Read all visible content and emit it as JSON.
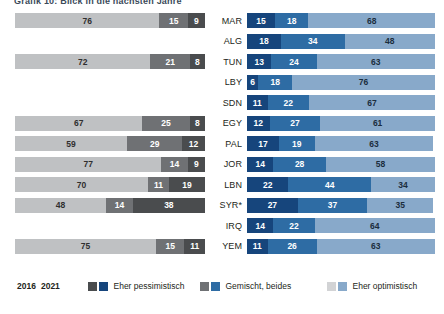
{
  "title": "Grafik 10: Blick in die nächsten Jahre",
  "legend": {
    "year_2016": "2016",
    "year_2021": "2021",
    "items": [
      {
        "label": "Eher pessimistisch",
        "color_2016": "#4a4c4e",
        "color_2021": "#16457c"
      },
      {
        "label": "Gemischt, beides",
        "color_2016": "#6f7174",
        "color_2021": "#2e6ca4"
      },
      {
        "label": "Eher optimistisch",
        "color_2016": "#bfc1c3",
        "color_2021": "#88a9ca"
      }
    ]
  },
  "chart_data": {
    "type": "bar",
    "title": "Grafik 10: Blick in die nächsten Jahre",
    "xlabel": "",
    "ylabel": "",
    "xlim": [
      0,
      100
    ],
    "grid": false,
    "legend_position": "bottom",
    "orientation": "horizontal",
    "stacked": true,
    "categories": [
      "MAR",
      "ALG",
      "TUN",
      "LBY",
      "SDN",
      "EGY",
      "PAL",
      "JOR",
      "LBN",
      "SYR*",
      "IRQ",
      "YEM"
    ],
    "panels": [
      {
        "name": "2016",
        "series": [
          {
            "name": "Eher optimistisch",
            "color": "#bfc1c3",
            "values": [
              76,
              null,
              72,
              null,
              null,
              67,
              59,
              77,
              70,
              48,
              null,
              75
            ]
          },
          {
            "name": "Gemischt, beides",
            "color": "#6f7174",
            "values": [
              15,
              null,
              21,
              null,
              null,
              25,
              29,
              14,
              11,
              14,
              null,
              15
            ]
          },
          {
            "name": "Eher pessimistisch",
            "color": "#4a4c4e",
            "values": [
              9,
              null,
              8,
              null,
              null,
              8,
              12,
              9,
              19,
              38,
              null,
              11
            ]
          }
        ]
      },
      {
        "name": "2021",
        "series": [
          {
            "name": "Eher pessimistisch",
            "color": "#16457c",
            "values": [
              15,
              18,
              13,
              6,
              11,
              12,
              17,
              14,
              22,
              27,
              14,
              11
            ]
          },
          {
            "name": "Gemischt, beides",
            "color": "#2e6ca4",
            "values": [
              18,
              34,
              24,
              18,
              22,
              27,
              19,
              28,
              44,
              37,
              22,
              26
            ]
          },
          {
            "name": "Eher optimistisch",
            "color": "#88a9ca",
            "values": [
              68,
              48,
              63,
              76,
              67,
              61,
              63,
              58,
              34,
              35,
              64,
              63
            ]
          }
        ]
      }
    ]
  },
  "rows": [
    {
      "country": "MAR",
      "left": {
        "present": true,
        "opt": "76",
        "mix": "15",
        "pes": "9"
      },
      "right": {
        "pes": "15",
        "mix": "18",
        "opt": "68"
      }
    },
    {
      "country": "ALG",
      "left": {
        "present": false,
        "opt": "",
        "mix": "",
        "pes": ""
      },
      "right": {
        "pes": "18",
        "mix": "34",
        "opt": "48"
      }
    },
    {
      "country": "TUN",
      "left": {
        "present": true,
        "opt": "72",
        "mix": "21",
        "pes": "8"
      },
      "right": {
        "pes": "13",
        "mix": "24",
        "opt": "63"
      }
    },
    {
      "country": "LBY",
      "left": {
        "present": false,
        "opt": "",
        "mix": "",
        "pes": ""
      },
      "right": {
        "pes": "6",
        "mix": "18",
        "opt": "76"
      }
    },
    {
      "country": "SDN",
      "left": {
        "present": false,
        "opt": "",
        "mix": "",
        "pes": ""
      },
      "right": {
        "pes": "11",
        "mix": "22",
        "opt": "67"
      }
    },
    {
      "country": "EGY",
      "left": {
        "present": true,
        "opt": "67",
        "mix": "25",
        "pes": "8"
      },
      "right": {
        "pes": "12",
        "mix": "27",
        "opt": "61"
      }
    },
    {
      "country": "PAL",
      "left": {
        "present": true,
        "opt": "59",
        "mix": "29",
        "pes": "12"
      },
      "right": {
        "pes": "17",
        "mix": "19",
        "opt": "63"
      }
    },
    {
      "country": "JOR",
      "left": {
        "present": true,
        "opt": "77",
        "mix": "14",
        "pes": "9"
      },
      "right": {
        "pes": "14",
        "mix": "28",
        "opt": "58"
      }
    },
    {
      "country": "LBN",
      "left": {
        "present": true,
        "opt": "70",
        "mix": "11",
        "pes": "19"
      },
      "right": {
        "pes": "22",
        "mix": "44",
        "opt": "34"
      }
    },
    {
      "country": "SYR*",
      "left": {
        "present": true,
        "opt": "48",
        "mix": "14",
        "pes": "38"
      },
      "right": {
        "pes": "27",
        "mix": "37",
        "opt": "35"
      }
    },
    {
      "country": "IRQ",
      "left": {
        "present": false,
        "opt": "",
        "mix": "",
        "pes": ""
      },
      "right": {
        "pes": "14",
        "mix": "22",
        "opt": "64"
      }
    },
    {
      "country": "YEM",
      "left": {
        "present": true,
        "opt": "75",
        "mix": "15",
        "pes": "11"
      },
      "right": {
        "pes": "11",
        "mix": "26",
        "opt": "63"
      }
    }
  ]
}
